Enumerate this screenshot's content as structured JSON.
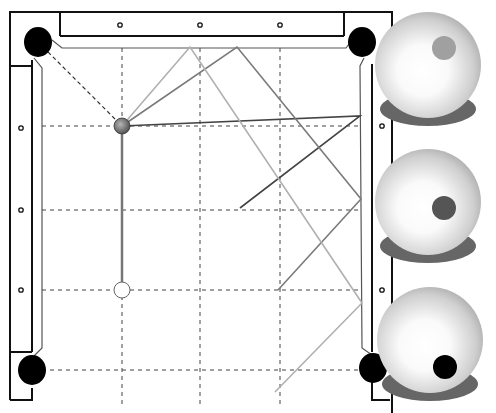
{
  "diagram": {
    "type": "billiards-shot-diagram",
    "table": {
      "rail_outer": {
        "left": 10,
        "top": 12,
        "right": 392
      },
      "diamonds_top": [
        [
          120,
          25
        ],
        [
          200,
          25
        ],
        [
          280,
          25
        ]
      ],
      "diamonds_left": [
        [
          21,
          128
        ],
        [
          21,
          210
        ],
        [
          21,
          290
        ]
      ],
      "diamonds_right": [
        [
          382,
          126
        ],
        [
          382,
          210
        ],
        [
          382,
          290
        ]
      ]
    },
    "pockets": [
      {
        "name": "top-left",
        "cx": 38,
        "cy": 42
      },
      {
        "name": "top-right",
        "cx": 362,
        "cy": 42
      },
      {
        "name": "bottom-left",
        "cx": 32,
        "cy": 370
      },
      {
        "name": "bottom-right",
        "cx": 373,
        "cy": 368
      }
    ],
    "grid": {
      "x": [
        122,
        200,
        280
      ],
      "y": [
        126,
        210,
        290,
        370
      ]
    },
    "balls": {
      "object_ball": {
        "cx": 122,
        "cy": 126,
        "color": "#777777"
      },
      "cue_ball": {
        "cx": 122,
        "cy": 290,
        "color": "#ffffff"
      }
    },
    "paths": [
      {
        "name": "dark-path",
        "color": "#444444",
        "points": [
          [
            122,
            126
          ],
          [
            360,
            116
          ],
          [
            240,
            208
          ]
        ]
      },
      {
        "name": "medium-path",
        "color": "#7a7a7a",
        "points": [
          [
            122,
            126
          ],
          [
            237,
            47
          ],
          [
            361,
            199
          ],
          [
            278,
            290
          ]
        ]
      },
      {
        "name": "light-path",
        "color": "#b0b0b0",
        "points": [
          [
            122,
            126
          ],
          [
            190,
            47
          ],
          [
            362,
            303
          ],
          [
            275,
            392
          ]
        ]
      }
    ],
    "spin_balls": [
      {
        "name": "spin-top-right",
        "cx": 428,
        "cy": 65,
        "dot": {
          "cx": 444,
          "cy": 48,
          "r": 12,
          "color": "#a0a0a0"
        }
      },
      {
        "name": "spin-center-right",
        "cx": 428,
        "cy": 202,
        "dot": {
          "cx": 444,
          "cy": 208,
          "r": 12,
          "color": "#555555"
        }
      },
      {
        "name": "spin-bottom-right",
        "cx": 430,
        "cy": 340,
        "dot": {
          "cx": 445,
          "cy": 367,
          "r": 12,
          "color": "#000000"
        }
      }
    ]
  }
}
